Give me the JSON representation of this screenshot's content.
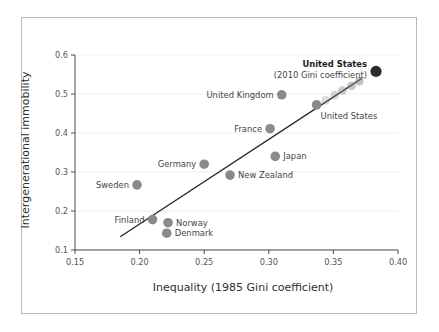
{
  "chart_data": {
    "type": "scatter",
    "title": "",
    "xlabel": "Inequality (1985 Gini coefficient)",
    "ylabel": "Intergenerational immobility",
    "xlim": [
      0.15,
      0.4
    ],
    "ylim": [
      0.1,
      0.6
    ],
    "xticks": [
      "0.15",
      "0.20",
      "0.25",
      "0.30",
      "0.35",
      "0.40"
    ],
    "xtick_values": [
      0.15,
      0.2,
      0.25,
      0.3,
      0.35,
      0.4
    ],
    "yticks": [
      "0.1",
      "0.2",
      "0.3",
      "0.4",
      "0.5",
      "0.6"
    ],
    "ytick_values": [
      0.1,
      0.2,
      0.3,
      0.4,
      0.5,
      0.6
    ],
    "grid": false,
    "legend": "none",
    "marker_color": "#8a8a8a",
    "highlight_color": "#2b2b2b",
    "trendline_color": "#2b2b2b",
    "points": [
      {
        "label": "Sweden",
        "x": 0.198,
        "y": 0.267,
        "label_side": "left",
        "bold": false
      },
      {
        "label": "Finland",
        "x": 0.21,
        "y": 0.178,
        "label_side": "left",
        "bold": false
      },
      {
        "label": "Norway",
        "x": 0.222,
        "y": 0.17,
        "label_side": "right",
        "bold": false
      },
      {
        "label": "Denmark",
        "x": 0.221,
        "y": 0.143,
        "label_side": "right",
        "bold": false
      },
      {
        "label": "Germany",
        "x": 0.25,
        "y": 0.32,
        "label_side": "left",
        "bold": false
      },
      {
        "label": "New Zealand",
        "x": 0.27,
        "y": 0.292,
        "label_side": "right",
        "bold": false
      },
      {
        "label": "France",
        "x": 0.301,
        "y": 0.411,
        "label_side": "left",
        "bold": false
      },
      {
        "label": "Japan",
        "x": 0.305,
        "y": 0.34,
        "label_side": "right",
        "bold": false
      },
      {
        "label": "United Kingdom",
        "x": 0.31,
        "y": 0.498,
        "label_side": "left",
        "bold": false
      },
      {
        "label": "United States",
        "x": 0.337,
        "y": 0.472,
        "label_side": "below-right",
        "bold": false
      },
      {
        "label": "United States",
        "x": 0.383,
        "y": 0.558,
        "label_side": "upper-left",
        "bold": true
      }
    ],
    "annotation": "(2010 Gini coefficient)",
    "trail": {
      "description": "fading trail of markers from United States 1985 point to United States 2010 point",
      "points": [
        {
          "x": 0.344,
          "y": 0.484,
          "opacity": 0.3
        },
        {
          "x": 0.351,
          "y": 0.497,
          "opacity": 0.36
        },
        {
          "x": 0.357,
          "y": 0.509,
          "opacity": 0.42
        },
        {
          "x": 0.364,
          "y": 0.521,
          "opacity": 0.48
        },
        {
          "x": 0.37,
          "y": 0.533,
          "opacity": 0.54
        }
      ]
    },
    "trendline": {
      "x0": 0.185,
      "y0": 0.134,
      "x1": 0.372,
      "y1": 0.54
    }
  },
  "axes": {
    "x_title": "Inequality (1985 Gini coefficient)",
    "y_title": "Intergenerational immobility"
  }
}
